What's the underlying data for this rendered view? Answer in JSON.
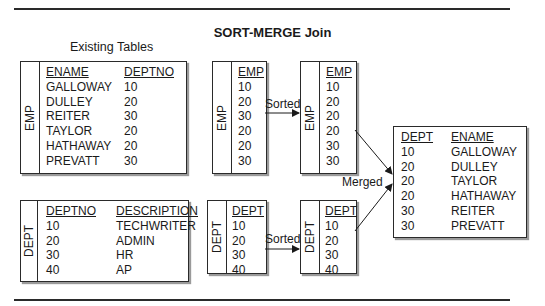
{
  "title": "SORT-MERGE Join",
  "subtitle": "Existing Tables",
  "emp_table": {
    "label": "EMP",
    "headers": [
      "ENAME",
      "DEPTNO"
    ],
    "ename": [
      "GALLOWAY",
      "DULLEY",
      "REITER",
      "TAYLOR",
      "HATHAWAY",
      "PREVATT"
    ],
    "deptno": [
      "10",
      "20",
      "30",
      "20",
      "20",
      "30"
    ]
  },
  "dept_table": {
    "label": "DEPT",
    "headers": [
      "DEPTNO",
      "DESCRIPTION"
    ],
    "deptno": [
      "10",
      "20",
      "30",
      "40"
    ],
    "description": [
      "TECHWRITER",
      "ADMIN",
      "HR",
      "AP"
    ]
  },
  "emp_unsorted": {
    "label": "EMP",
    "header": "EMP",
    "values": [
      "10",
      "20",
      "30",
      "20",
      "20",
      "30"
    ]
  },
  "emp_sorted": {
    "label": "EMP",
    "header": "EMP",
    "values": [
      "10",
      "20",
      "20",
      "20",
      "30",
      "30"
    ]
  },
  "dept_unsorted": {
    "label": "DEPT",
    "header": "DEPT",
    "values": [
      "10",
      "20",
      "30",
      "40"
    ]
  },
  "dept_sorted": {
    "label": "DEPT",
    "header": "DEPT",
    "values": [
      "10",
      "20",
      "30",
      "40"
    ]
  },
  "result": {
    "headers": [
      "DEPT",
      "ENAME"
    ],
    "dept": [
      "10",
      "20",
      "20",
      "20",
      "30",
      "30"
    ],
    "ename": [
      "GALLOWAY",
      "DULLEY",
      "TAYLOR",
      "HATHAWAY",
      "REITER",
      "PREVATT"
    ]
  },
  "arrows": {
    "sorted_top": "Sorted",
    "sorted_bottom": "Sorted",
    "merged": "Merged"
  }
}
